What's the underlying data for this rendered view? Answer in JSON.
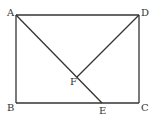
{
  "diagram": {
    "type": "geometry",
    "points": {
      "A": "A",
      "B": "B",
      "C": "C",
      "D": "D",
      "E": "E",
      "F": "F"
    },
    "segments": [
      [
        "A",
        "D"
      ],
      [
        "A",
        "B"
      ],
      [
        "B",
        "C"
      ],
      [
        "C",
        "D"
      ],
      [
        "A",
        "E"
      ],
      [
        "D",
        "F"
      ]
    ],
    "line_color": "#333333"
  }
}
